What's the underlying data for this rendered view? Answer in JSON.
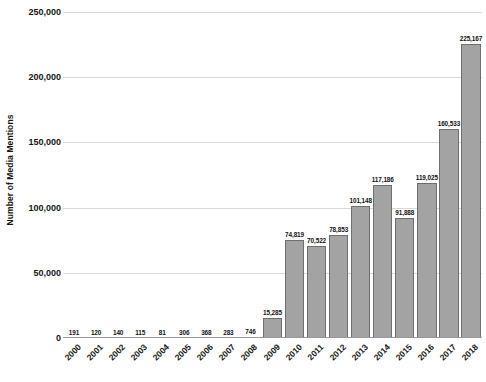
{
  "chart_data": {
    "type": "bar",
    "title": "",
    "subtitle": "",
    "xlabel": "",
    "ylabel": "Number of Media Mentions",
    "grid": true,
    "legend": false,
    "legend_position": "none",
    "orientation": "vertical",
    "ylim": [
      0,
      250000
    ],
    "y_ticks": [
      0,
      50000,
      100000,
      150000,
      200000,
      250000
    ],
    "y_tick_labels": [
      "0",
      "50,000",
      "100,000",
      "150,000",
      "200,000",
      "250,000"
    ],
    "categories": [
      "2000",
      "2001",
      "2002",
      "2003",
      "2004",
      "2005",
      "2006",
      "2007",
      "2008",
      "2009",
      "2010",
      "2011",
      "2012",
      "2013",
      "2014",
      "2015",
      "2016",
      "2017",
      "2018"
    ],
    "values": [
      191,
      120,
      140,
      115,
      81,
      306,
      368,
      283,
      746,
      15285,
      74819,
      70522,
      78853,
      101148,
      117186,
      91888,
      119025,
      160533,
      225167
    ],
    "value_labels": [
      "191",
      "120",
      "140",
      "115",
      "81",
      "306",
      "368",
      "283",
      "746",
      "15,285",
      "74,819",
      "70,522",
      "78,853",
      "101,148",
      "117,186",
      "91,888",
      "119,025",
      "160,533",
      "225,167"
    ],
    "colors": {
      "bar_fill": "#a3a3a3",
      "bar_border": "#6f6f6f",
      "gridline": "#d9d9d9",
      "axis_line": "#9a9a9a",
      "text": "#161616",
      "background": "#ffffff"
    }
  }
}
